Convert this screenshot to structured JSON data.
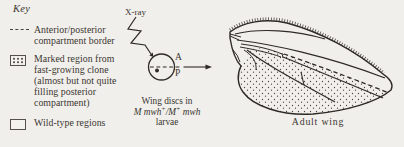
{
  "colors": {
    "background": "#f1efeb",
    "ink": "#2e2b27",
    "text": "#3a3631"
  },
  "key": {
    "title": "Key",
    "items": [
      {
        "icon": "dashed-line-icon",
        "label": "Anterior/posterior compartment border"
      },
      {
        "icon": "stippled-box-icon",
        "label": "Marked region from fast-growing clone (almost but not quite filling posterior compartment)"
      },
      {
        "icon": "open-box-icon",
        "label": "Wild-type regions"
      }
    ]
  },
  "middle": {
    "xray_label": "X-ray",
    "anterior_label": "A",
    "posterior_label": "P",
    "caption_line1": "Wing discs in",
    "genotype": {
      "p1": "M mwh",
      "s1": "+",
      "p2": "/M",
      "s2": "+",
      "p3": " mwh"
    },
    "caption_line3": "larvae"
  },
  "wing": {
    "caption": "Adult wing"
  }
}
